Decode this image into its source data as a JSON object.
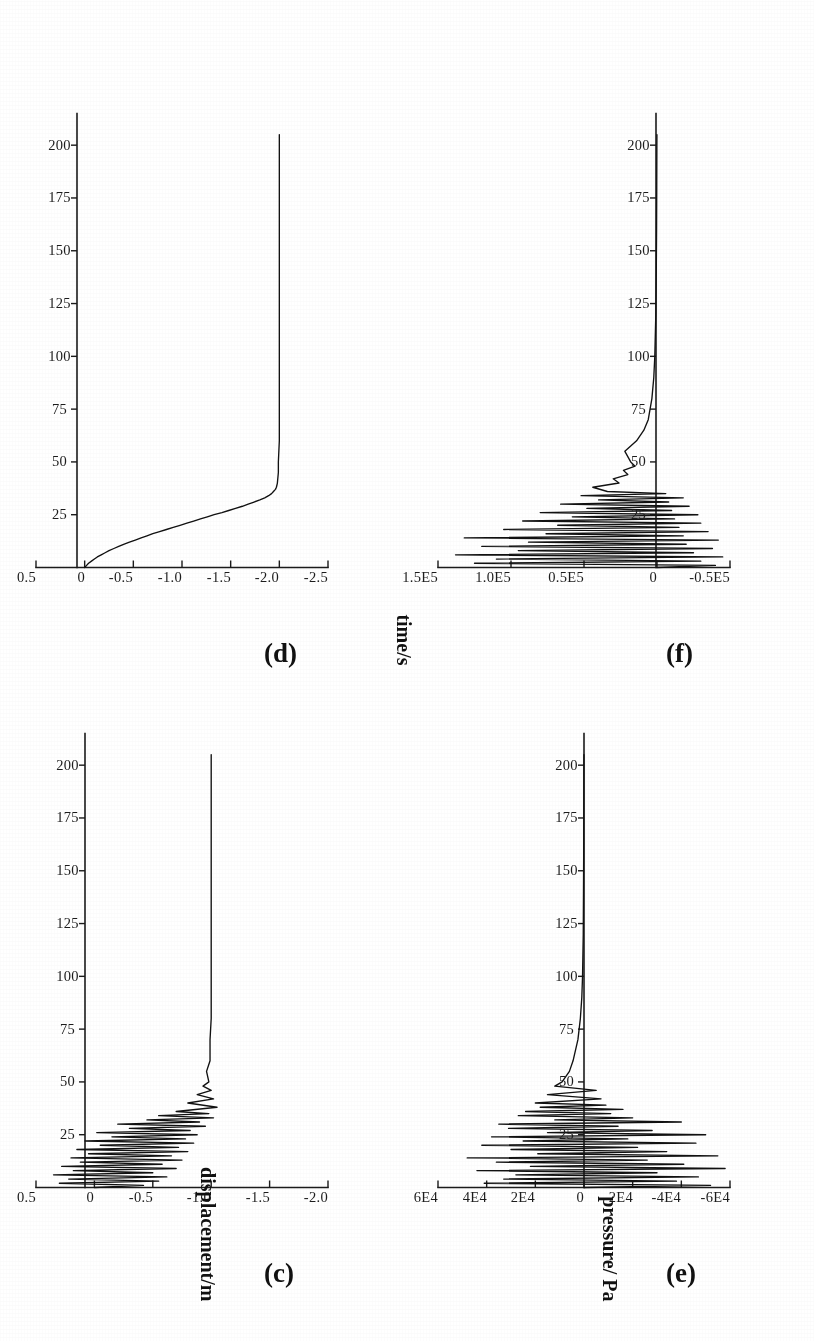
{
  "document": {
    "kind": "scanned-figure",
    "rotation_degrees": -90,
    "background_color": "#ffffff",
    "ink_color": "#111111"
  },
  "shared_axis_titles": {
    "time": "time/s",
    "displacement": "displacement/m",
    "pressure": "pressure/ Pa"
  },
  "panels": [
    {
      "id": "c",
      "label": "(c)",
      "quantity": "displacement",
      "y_unit": "m"
    },
    {
      "id": "d",
      "label": "(d)",
      "quantity": "displacement",
      "y_unit": "m"
    },
    {
      "id": "e",
      "label": "(e)",
      "quantity": "pressure",
      "y_unit": "Pa"
    },
    {
      "id": "f",
      "label": "(f)",
      "quantity": "pressure",
      "y_unit": "Pa"
    }
  ],
  "chart_data": [
    {
      "panel": "c",
      "type": "line",
      "title": "(c)",
      "xlabel": "time/s",
      "ylabel": "displacement/m",
      "xlim": [
        0,
        215
      ],
      "ylim": [
        -2.0,
        0.5
      ],
      "xticks": [
        25,
        50,
        75,
        100,
        125,
        150,
        175,
        200
      ],
      "xtick_labels": [
        "25",
        "50",
        "75",
        "100",
        "125",
        "150",
        "175",
        "200"
      ],
      "yticks": [
        0.5,
        0,
        -0.5,
        -1.0,
        -1.5,
        -2.0
      ],
      "ytick_labels": [
        "0.5",
        "0",
        "-0.5",
        "-1.0",
        "-1.5",
        "-2.0"
      ],
      "grid": false,
      "legend": "none",
      "series": [
        {
          "name": "displacement",
          "x": [
            0,
            1,
            2,
            3,
            4,
            5,
            6,
            7,
            8,
            9,
            10,
            11,
            12,
            13,
            14,
            15,
            16,
            17,
            18,
            19,
            20,
            21,
            22,
            23,
            24,
            25,
            26,
            27,
            28,
            29,
            30,
            31,
            32,
            33,
            34,
            35,
            36,
            38,
            40,
            42,
            44,
            46,
            48,
            50,
            55,
            60,
            70,
            80,
            90,
            100,
            110,
            120,
            130,
            140,
            150,
            160,
            170,
            180,
            190,
            200,
            205
          ],
          "y": [
            0.0,
            -0.42,
            0.3,
            -0.55,
            0.22,
            -0.62,
            0.35,
            -0.5,
            0.18,
            -0.7,
            0.28,
            -0.58,
            0.12,
            -0.75,
            0.2,
            -0.66,
            0.05,
            -0.8,
            0.15,
            -0.72,
            -0.05,
            -0.85,
            0.08,
            -0.78,
            -0.15,
            -0.88,
            -0.02,
            -0.82,
            -0.3,
            -0.95,
            -0.2,
            -0.9,
            -0.45,
            -1.02,
            -0.55,
            -0.98,
            -0.7,
            -1.05,
            -0.8,
            -1.02,
            -0.88,
            -1.0,
            -0.93,
            -0.98,
            -0.96,
            -0.99,
            -0.99,
            -1.0,
            -1.0,
            -1.0,
            -1.0,
            -1.0,
            -1.0,
            -1.0,
            -1.0,
            -1.0,
            -1.0,
            -1.0,
            -1.0,
            -1.0,
            -1.0
          ]
        }
      ],
      "description": "Strongly oscillating displacement for the first ~35 s, damping out and settling to a steady value near -1.0 m for the remainder of the record."
    },
    {
      "panel": "d",
      "type": "line",
      "title": "(d)",
      "xlabel": "time/s",
      "ylabel": "displacement/m",
      "xlim": [
        0,
        215
      ],
      "ylim": [
        -2.5,
        0.5
      ],
      "xticks": [
        25,
        50,
        75,
        100,
        125,
        150,
        175,
        200
      ],
      "xtick_labels": [
        "25",
        "50",
        "75",
        "100",
        "125",
        "150",
        "175",
        "200"
      ],
      "yticks": [
        0.5,
        0,
        -0.5,
        -1.0,
        -1.5,
        -2.0,
        -2.5
      ],
      "ytick_labels": [
        "0.5",
        "0",
        "-0.5",
        "-1.0",
        "-1.5",
        "-2.0",
        "-2.5"
      ],
      "grid": false,
      "legend": "none",
      "series": [
        {
          "name": "displacement",
          "x": [
            0,
            1,
            2,
            3,
            4,
            5,
            6,
            7,
            8,
            9,
            10,
            11,
            12,
            13,
            14,
            15,
            16,
            17,
            18,
            19,
            20,
            21,
            22,
            23,
            24,
            25,
            26,
            27,
            28,
            29,
            30,
            31,
            32,
            33,
            34,
            35,
            36,
            37,
            38,
            40,
            45,
            50,
            60,
            70,
            80,
            100,
            120,
            140,
            160,
            180,
            200,
            205
          ],
          "y": [
            0.0,
            -0.02,
            -0.04,
            -0.07,
            -0.1,
            -0.13,
            -0.17,
            -0.21,
            -0.25,
            -0.3,
            -0.35,
            -0.4,
            -0.46,
            -0.52,
            -0.58,
            -0.64,
            -0.7,
            -0.77,
            -0.84,
            -0.91,
            -0.98,
            -1.05,
            -1.12,
            -1.19,
            -1.26,
            -1.33,
            -1.41,
            -1.48,
            -1.55,
            -1.62,
            -1.68,
            -1.74,
            -1.8,
            -1.85,
            -1.89,
            -1.92,
            -1.94,
            -1.96,
            -1.97,
            -1.98,
            -1.99,
            -1.99,
            -2.0,
            -2.0,
            -2.0,
            -2.0,
            -2.0,
            -2.0,
            -2.0,
            -2.0,
            -2.0,
            -2.0
          ]
        }
      ],
      "description": "Monotonic, slightly stepped subsidence from 0 m, steepening through the first ~35 s and then saturating at about -2.0 m for the rest of the record."
    },
    {
      "panel": "e",
      "type": "line",
      "title": "(e)",
      "xlabel": "time/s",
      "ylabel": "pressure/ Pa",
      "xlim": [
        0,
        215
      ],
      "ylim": [
        -60000,
        60000
      ],
      "xticks": [
        25,
        50,
        75,
        100,
        125,
        150,
        175,
        200
      ],
      "xtick_labels": [
        "25",
        "50",
        "75",
        "100",
        "125",
        "150",
        "175",
        "200"
      ],
      "yticks": [
        60000,
        40000,
        20000,
        0,
        -20000,
        -40000,
        -60000
      ],
      "ytick_labels": [
        "6E4",
        "4E4",
        "2E4",
        "0",
        "-2E4",
        "-4E4",
        "-6E4"
      ],
      "grid": false,
      "legend": "none",
      "series": [
        {
          "name": "pressure",
          "x": [
            0,
            1,
            2,
            3,
            4,
            5,
            6,
            7,
            8,
            9,
            10,
            11,
            12,
            13,
            14,
            15,
            16,
            17,
            18,
            19,
            20,
            21,
            22,
            23,
            24,
            25,
            26,
            27,
            28,
            29,
            30,
            31,
            32,
            33,
            34,
            35,
            36,
            37,
            38,
            39,
            40,
            42,
            44,
            46,
            48,
            50,
            55,
            60,
            70,
            80,
            90,
            100,
            120,
            140,
            160,
            180,
            200,
            205
          ],
          "y": [
            0,
            -52000,
            41000,
            -38000,
            33000,
            -47000,
            28000,
            -30000,
            44000,
            -58000,
            22000,
            -41000,
            36000,
            -26000,
            48000,
            -55000,
            19000,
            -34000,
            30000,
            -22000,
            42000,
            -46000,
            25000,
            -18000,
            38000,
            -50000,
            15000,
            -28000,
            31000,
            -14000,
            35000,
            -40000,
            12000,
            -20000,
            27000,
            -11000,
            24000,
            -16000,
            18000,
            -9000,
            20000,
            -7000,
            15000,
            -5000,
            12000,
            9000,
            6000,
            4500,
            2500,
            1500,
            900,
            600,
            300,
            200,
            120,
            80,
            40,
            20
          ]
        }
      ],
      "description": "Large bipolar pressure oscillations of up to about 6E4 Pa in the first ~30 s, decaying rapidly; after ~55 s the trace is essentially flat at 0 Pa."
    },
    {
      "panel": "f",
      "type": "line",
      "title": "(f)",
      "xlabel": "time/s",
      "ylabel": "pressure/ Pa",
      "xlim": [
        0,
        215
      ],
      "ylim": [
        -50000,
        150000
      ],
      "xticks": [
        25,
        50,
        75,
        100,
        125,
        150,
        175,
        200
      ],
      "xtick_labels": [
        "25",
        "50",
        "75",
        "100",
        "125",
        "150",
        "175",
        "200"
      ],
      "yticks": [
        150000,
        100000,
        50000,
        0,
        -50000
      ],
      "ytick_labels": [
        "1.5E5",
        "1.0E5",
        "0.5E5",
        "0",
        "-0.5E5"
      ],
      "grid": false,
      "legend": "none",
      "series": [
        {
          "name": "pressure",
          "x": [
            0,
            1,
            2,
            3,
            4,
            5,
            6,
            7,
            8,
            9,
            10,
            11,
            12,
            13,
            14,
            15,
            16,
            17,
            18,
            19,
            20,
            21,
            22,
            23,
            24,
            25,
            26,
            27,
            28,
            29,
            30,
            31,
            32,
            33,
            34,
            35,
            36,
            38,
            40,
            42,
            44,
            46,
            48,
            50,
            55,
            60,
            65,
            70,
            80,
            90,
            100,
            120,
            140,
            160,
            180,
            200,
            205
          ],
          "y": [
            0,
            -40000,
            125000,
            -30000,
            110000,
            -45000,
            138000,
            -25000,
            95000,
            -38000,
            120000,
            -20000,
            88000,
            -42000,
            132000,
            -18000,
            76000,
            -35000,
            105000,
            -15000,
            68000,
            -30000,
            92000,
            -12000,
            58000,
            -28000,
            80000,
            -10000,
            48000,
            -22000,
            66000,
            -8000,
            40000,
            -18000,
            52000,
            -6000,
            34000,
            44000,
            26000,
            30000,
            20000,
            23000,
            15000,
            18000,
            22000,
            14000,
            9000,
            6000,
            3500,
            2200,
            1500,
            800,
            500,
            300,
            180,
            90,
            50
          ]
        }
      ],
      "description": "Violent pressure spikes reaching roughly 1.4E5 Pa during the first ~35 s with negative excursions near -0.5E5 Pa, then a small smooth hump around 50-75 s and a flat near-zero tail out to 200 s."
    }
  ]
}
